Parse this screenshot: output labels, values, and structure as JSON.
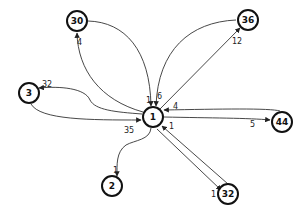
{
  "graph": {
    "nodes": [
      {
        "id": "1",
        "label": "1",
        "x": 153,
        "y": 117
      },
      {
        "id": "30",
        "label": "30",
        "x": 77,
        "y": 21
      },
      {
        "id": "36",
        "label": "36",
        "x": 248,
        "y": 20
      },
      {
        "id": "3",
        "label": "3",
        "x": 29,
        "y": 93
      },
      {
        "id": "44",
        "label": "44",
        "x": 282,
        "y": 122
      },
      {
        "id": "2",
        "label": "2",
        "x": 112,
        "y": 186
      },
      {
        "id": "32",
        "label": "32",
        "x": 228,
        "y": 194
      }
    ],
    "edges": [
      {
        "from": "1",
        "to": "30",
        "label": "4"
      },
      {
        "from": "30",
        "to": "1",
        "label": "1"
      },
      {
        "from": "36",
        "to": "1",
        "label": "6"
      },
      {
        "from": "1",
        "to": "36",
        "label": "12"
      },
      {
        "from": "1",
        "to": "3",
        "label": "32"
      },
      {
        "from": "3",
        "to": "1",
        "label": "35"
      },
      {
        "from": "44",
        "to": "1",
        "label": "4"
      },
      {
        "from": "1",
        "to": "44",
        "label": "5"
      },
      {
        "from": "1",
        "to": "2",
        "label": "1"
      },
      {
        "from": "32",
        "to": "1",
        "label": "1"
      },
      {
        "from": "1",
        "to": "32",
        "label": "1"
      }
    ]
  },
  "labels": {
    "n1": "1",
    "n30": "30",
    "n36": "36",
    "n3": "3",
    "n44": "44",
    "n2": "2",
    "n32": "32",
    "e_1_30": "4",
    "e_30_1": "1",
    "e_36_1": "6",
    "e_1_36": "12",
    "e_1_3": "32",
    "e_3_1": "35",
    "e_44_1": "4",
    "e_1_44": "5",
    "e_1_2": "1",
    "e_32_1": "1",
    "e_1_32": "1"
  }
}
